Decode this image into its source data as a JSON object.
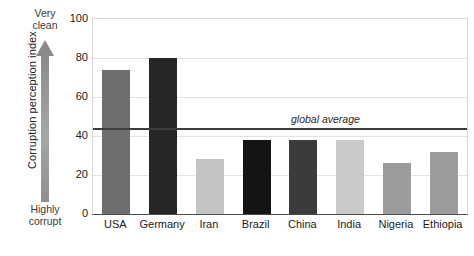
{
  "chart_data": {
    "type": "bar",
    "title": "",
    "xlabel": "",
    "ylabel": "Corruption perception index",
    "categories": [
      "USA",
      "Germany",
      "Iran",
      "Brazil",
      "China",
      "India",
      "Nigeria",
      "Ethiopia"
    ],
    "values": [
      74,
      80,
      28,
      38,
      38,
      38,
      26,
      32
    ],
    "bar_colors": [
      "#6e6e6e",
      "#262626",
      "#c3c3c3",
      "#141414",
      "#3b3b3b",
      "#cacaca",
      "#9b9b9b",
      "#9b9b9b"
    ],
    "ylim": [
      0,
      100
    ],
    "yticks": [
      0,
      20,
      40,
      60,
      80,
      100
    ],
    "ytick_labels": [
      "0",
      "20",
      "40",
      "60",
      "80",
      "100"
    ],
    "grid": true,
    "legend": "none",
    "annotations": [
      {
        "name": "global-average",
        "label": "global average",
        "value": 44,
        "style": "horizontal-line"
      },
      {
        "name": "axis-top-direction",
        "label": "Very\nclean"
      },
      {
        "name": "axis-bottom-direction",
        "label": "Highly\ncorrupt"
      }
    ]
  },
  "axis": {
    "y_title": "Corruption perception index",
    "top_direction_line1": "Very",
    "top_direction_line2": "clean",
    "bottom_direction_line1": "Highly",
    "bottom_direction_line2": "corrupt"
  },
  "annotation": {
    "global_average_label": "global average"
  },
  "colors": {
    "gridline": "#e3e3e3",
    "axis": "#4a4a4a",
    "average_line": "#3d3d3d",
    "arrow": "#8a8a8a",
    "background": "#ffffff"
  }
}
